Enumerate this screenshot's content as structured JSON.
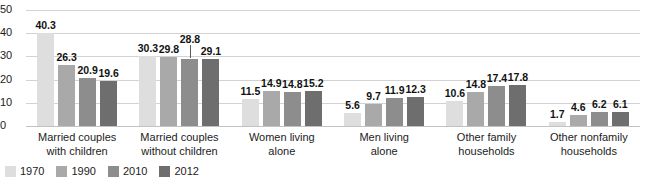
{
  "chart_data": {
    "type": "bar",
    "title": "",
    "subtitle": "",
    "xlabel": "",
    "ylabel": "",
    "ylim": [
      0,
      50
    ],
    "yticks": [
      0,
      10,
      20,
      30,
      40,
      50
    ],
    "ytick_labels": [
      "0",
      "10",
      "20",
      "30",
      "40",
      "50"
    ],
    "grid": true,
    "legend_position": "bottom-left",
    "categories": [
      "Married couples with children",
      "Married couples without children",
      "Women living alone",
      "Men living alone",
      "Other family households",
      "Other nonfamily households"
    ],
    "category_lines": [
      [
        "Married couples",
        "with children"
      ],
      [
        "Married couples",
        "without children"
      ],
      [
        "Women living",
        "alone"
      ],
      [
        "Men living",
        "alone"
      ],
      [
        "Other family",
        "households"
      ],
      [
        "Other nonfamily",
        "households"
      ]
    ],
    "series": [
      {
        "name": "1970",
        "color": "#dedede",
        "values": [
          40.3,
          30.3,
          11.5,
          5.6,
          10.6,
          1.7
        ],
        "labels": [
          "40.3",
          "30.3",
          "11.5",
          "5.6",
          "10.6",
          "1.7"
        ]
      },
      {
        "name": "1990",
        "color": "#a9a9a9",
        "values": [
          26.3,
          29.8,
          14.9,
          9.7,
          14.8,
          4.6
        ],
        "labels": [
          "26.3",
          "29.8",
          "14.9",
          "9.7",
          "14.8",
          "4.6"
        ]
      },
      {
        "name": "2010",
        "color": "#8d8d8d",
        "values": [
          20.9,
          28.8,
          14.8,
          11.9,
          17.4,
          6.2
        ],
        "labels": [
          "20.9",
          "28.8",
          "14.8",
          "11.9",
          "17.4",
          "6.2"
        ]
      },
      {
        "name": "2012",
        "color": "#6e6e6e",
        "values": [
          19.6,
          29.1,
          15.2,
          12.3,
          17.8,
          6.1
        ],
        "labels": [
          "19.6",
          "29.1",
          "15.2",
          "12.3",
          "17.8",
          "6.1"
        ]
      }
    ],
    "annotations": [
      {
        "series": "2010",
        "category": "Married couples without children",
        "label": "28.8",
        "style": "raised-with-leader-line"
      }
    ]
  },
  "legend": {
    "items": [
      {
        "label": "1970",
        "color": "#dedede"
      },
      {
        "label": "1990",
        "color": "#a9a9a9"
      },
      {
        "label": "2010",
        "color": "#8d8d8d"
      },
      {
        "label": "2012",
        "color": "#6e6e6e"
      }
    ]
  },
  "colors": {
    "background": "#ffffff",
    "gridline": "#d2d2d2",
    "baseline": "#c2c2c2",
    "text": "#1c1c1c",
    "value_label": "#121212"
  }
}
